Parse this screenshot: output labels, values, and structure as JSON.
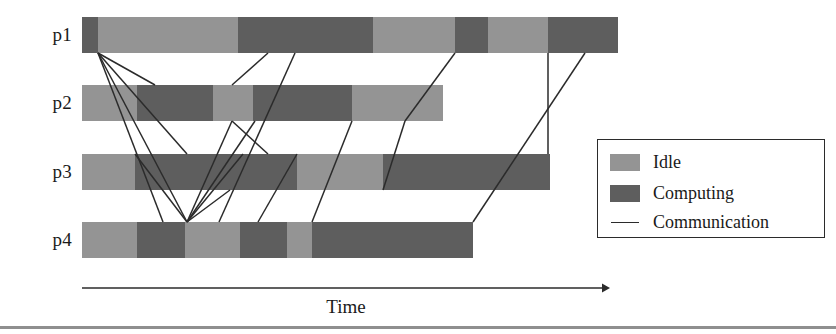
{
  "figure": {
    "background": "#ffffff",
    "idle_color": "#949494",
    "computing_color": "#5e5e5e",
    "line_color": "#2b2b2b"
  },
  "axis": {
    "caption": "Time",
    "x_start": 82,
    "x_end": 610,
    "y": 288,
    "arrow": "right-arrow-icon"
  },
  "legend": {
    "items": [
      {
        "label": "Idle",
        "kind": "swatch",
        "color": "#949494"
      },
      {
        "label": "Computing",
        "kind": "swatch",
        "color": "#5e5e5e"
      },
      {
        "label": "Communication",
        "kind": "line",
        "color": "#2b2b2b"
      }
    ]
  },
  "chart_data": {
    "type": "bar",
    "title": "",
    "xlabel": "Time",
    "ylabel": "",
    "orientation": "horizontal",
    "stacked": true,
    "grid": false,
    "legend_position": "right",
    "categories": [
      "p1",
      "p2",
      "p3",
      "p4"
    ],
    "state_legend": [
      "Idle",
      "Computing",
      "Communication"
    ],
    "series": [
      {
        "name": "p1",
        "row_y": 17,
        "segments": [
          {
            "state": "Computing",
            "x0": 82,
            "x1": 98
          },
          {
            "state": "Idle",
            "x0": 98,
            "x1": 238
          },
          {
            "state": "Computing",
            "x0": 238,
            "x1": 373
          },
          {
            "state": "Idle",
            "x0": 373,
            "x1": 455
          },
          {
            "state": "Computing",
            "x0": 455,
            "x1": 488
          },
          {
            "state": "Idle",
            "x0": 488,
            "x1": 548
          },
          {
            "state": "Computing",
            "x0": 548,
            "x1": 618
          }
        ]
      },
      {
        "name": "p2",
        "row_y": 85,
        "segments": [
          {
            "state": "Idle",
            "x0": 82,
            "x1": 137
          },
          {
            "state": "Computing",
            "x0": 137,
            "x1": 213
          },
          {
            "state": "Idle",
            "x0": 213,
            "x1": 253
          },
          {
            "state": "Computing",
            "x0": 253,
            "x1": 352
          },
          {
            "state": "Idle",
            "x0": 352,
            "x1": 443
          }
        ]
      },
      {
        "name": "p3",
        "row_y": 154,
        "segments": [
          {
            "state": "Idle",
            "x0": 82,
            "x1": 135
          },
          {
            "state": "Computing",
            "x0": 135,
            "x1": 297
          },
          {
            "state": "Idle",
            "x0": 297,
            "x1": 383
          },
          {
            "state": "Computing",
            "x0": 383,
            "x1": 550
          }
        ]
      },
      {
        "name": "p4",
        "row_y": 222,
        "segments": [
          {
            "state": "Idle",
            "x0": 82,
            "x1": 137
          },
          {
            "state": "Computing",
            "x0": 137,
            "x1": 185
          },
          {
            "state": "Idle",
            "x0": 185,
            "x1": 240
          },
          {
            "state": "Computing",
            "x0": 240,
            "x1": 287
          },
          {
            "state": "Idle",
            "x0": 287,
            "x1": 312
          },
          {
            "state": "Computing",
            "x0": 312,
            "x1": 473
          }
        ]
      }
    ],
    "communications": [
      {
        "from": "p1",
        "x0": 98,
        "y0": 53,
        "to": "p3",
        "x1": 187,
        "y1": 154
      },
      {
        "from": "p1",
        "x0": 98,
        "y0": 53,
        "to": "p4",
        "x1": 187,
        "y1": 222
      },
      {
        "from": "p1",
        "x0": 98,
        "y0": 53,
        "to": "p2",
        "x1": 155,
        "y1": 85
      },
      {
        "from": "p1",
        "x0": 98,
        "y0": 53,
        "to": "p4",
        "x1": 163,
        "y1": 222
      },
      {
        "from": "p1",
        "x0": 268,
        "y0": 53,
        "to": "p2",
        "x1": 232,
        "y1": 85
      },
      {
        "from": "p1",
        "x0": 295,
        "y0": 53,
        "to": "p4",
        "x1": 219,
        "y1": 222
      },
      {
        "from": "p1",
        "x0": 455,
        "y0": 53,
        "to": "p2",
        "x1": 405,
        "y1": 121
      },
      {
        "from": "p1",
        "x0": 548,
        "y0": 53,
        "to": "p3",
        "x1": 548,
        "y1": 154
      },
      {
        "from": "p1",
        "x0": 585,
        "y0": 53,
        "to": "p4",
        "x1": 473,
        "y1": 222
      },
      {
        "from": "p2",
        "x0": 232,
        "y0": 121,
        "to": "p4",
        "x1": 187,
        "y1": 222
      },
      {
        "from": "p2",
        "x0": 232,
        "y0": 121,
        "to": "p3",
        "x1": 268,
        "y1": 154
      },
      {
        "from": "p2",
        "x0": 352,
        "y0": 121,
        "to": "p4",
        "x1": 312,
        "y1": 222
      },
      {
        "from": "p2",
        "x0": 405,
        "y0": 121,
        "to": "p3",
        "x1": 383,
        "y1": 190
      },
      {
        "from": "p3",
        "x0": 135,
        "y0": 154,
        "to": "p4",
        "x1": 187,
        "y1": 222
      },
      {
        "from": "p3",
        "x0": 230,
        "y0": 190,
        "to": "p4",
        "x1": 187,
        "y1": 222
      },
      {
        "from": "p3",
        "x0": 297,
        "y0": 154,
        "to": "p4",
        "x1": 258,
        "y1": 222
      },
      {
        "from": "p4",
        "x0": 187,
        "y0": 222,
        "to": "p3",
        "x1": 243,
        "y1": 154
      },
      {
        "from": "p4",
        "x0": 187,
        "y0": 222,
        "to": "p2",
        "x1": 255,
        "y1": 121
      }
    ]
  }
}
